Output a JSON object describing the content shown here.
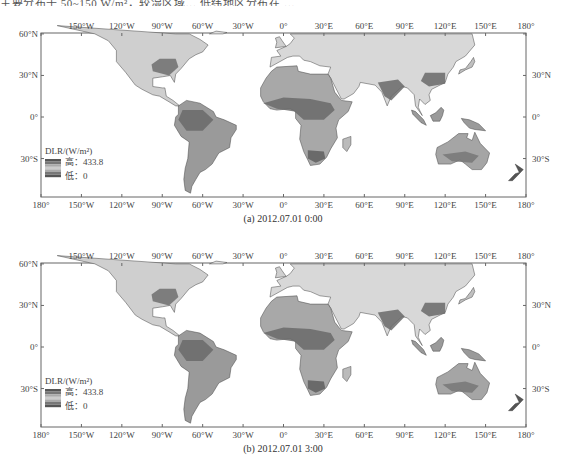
{
  "header": {
    "text": "主要分布于 50~150 W/m²，较湿区域… 低纬地区分布在 …"
  },
  "axes": {
    "lon_ticks": [
      "180°",
      "150°W",
      "120°W",
      "90°W",
      "60°W",
      "30°W",
      "0°",
      "30°E",
      "60°E",
      "90°E",
      "120°E",
      "150°E",
      "180°"
    ],
    "top_lon_ticks": [
      "150°W",
      "120°W",
      "90°W",
      "60°W",
      "30°W",
      "0°",
      "30°E",
      "60°E",
      "90°E",
      "120°E",
      "150°E",
      "180°"
    ],
    "lat_left": [
      "60°N",
      "30°N",
      "0°",
      "30°S"
    ],
    "lat_right": [
      "30°N",
      "0°",
      "30°S"
    ]
  },
  "legend": {
    "title": "DLR/(W/m²)",
    "high_label": "高：433.8",
    "low_label": "低：0",
    "max": 433.8,
    "min": 0
  },
  "panels": [
    {
      "id": "a",
      "caption": "(a) 2012.07.01 0:00"
    },
    {
      "id": "b",
      "caption": "(b) 2012.07.01 3:00"
    }
  ],
  "colors": {
    "high": "#555555",
    "mid": "#bdbdbd",
    "low": "#e6e6e6",
    "frame": "#666666"
  }
}
